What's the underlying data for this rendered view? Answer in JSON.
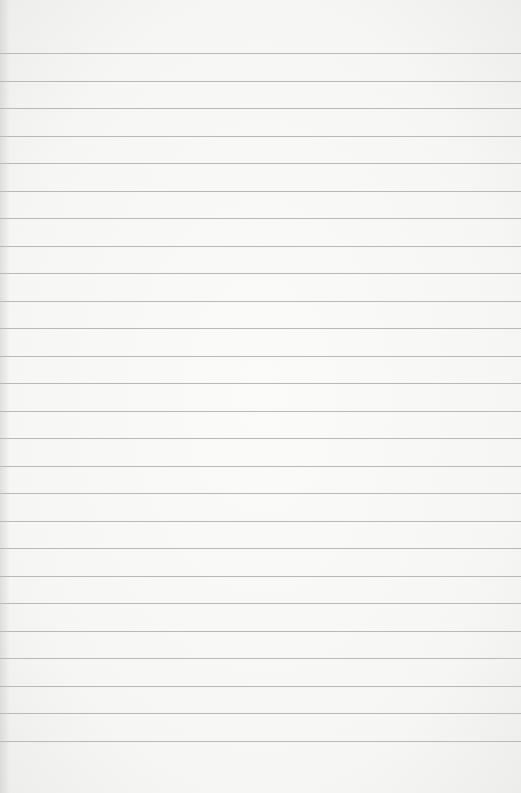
{
  "paper": {
    "type": "lined-paper",
    "background_color": "#f7f7f5",
    "line_color": "#b9b9b6",
    "first_line_y": 53,
    "line_spacing": 27.5,
    "line_count": 26
  }
}
